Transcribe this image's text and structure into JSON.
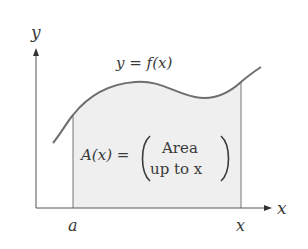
{
  "diagram": {
    "axes": {
      "y_label": "y",
      "x_label": "x"
    },
    "curve_label": "y = f(x)",
    "lower_bound_label": "a",
    "upper_bound_label": "x",
    "area_formula": {
      "lhs": "A(x) =",
      "rhs_line1": "Area",
      "rhs_line2": "up to x"
    },
    "colors": {
      "curve": "#6e6e6e",
      "axes": "#555555",
      "fill": "#efefef",
      "text": "#3a3a3a"
    }
  }
}
